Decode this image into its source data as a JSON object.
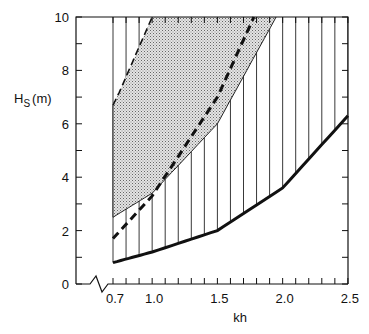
{
  "chart_data": {
    "type": "line",
    "title": "",
    "xlabel": "kh",
    "ylabel": "H_S (m)",
    "ylabel_main": "H",
    "ylabel_sub": "S",
    "ylabel_unit": "(m)",
    "xlim": [
      0.7,
      2.5
    ],
    "ylim": [
      0,
      10
    ],
    "x_axis_break": true,
    "x_ticks": [
      0.7,
      1.0,
      1.5,
      2.0,
      2.5
    ],
    "x_tick_labels": [
      "0.7",
      "1.0",
      "1.5",
      "2.0",
      "2.5"
    ],
    "y_ticks": [
      0,
      2,
      4,
      6,
      8,
      10
    ],
    "y_tick_labels": [
      "0",
      "2",
      "4",
      "6",
      "8",
      "10"
    ],
    "grid": false,
    "series": [
      {
        "name": "lower-bound-thick-solid",
        "style": "thick solid",
        "x": [
          0.7,
          1.0,
          1.5,
          2.0,
          2.5
        ],
        "y": [
          0.8,
          1.2,
          2.0,
          3.6,
          6.3
        ]
      },
      {
        "name": "thick-dashed",
        "style": "thick dashed",
        "x": [
          0.7,
          1.0,
          1.5,
          1.78
        ],
        "y": [
          1.7,
          3.3,
          7.0,
          10.0
        ]
      },
      {
        "name": "stippled-region-lower-edge",
        "style": "thin solid",
        "x": [
          0.7,
          1.0,
          1.5,
          1.95
        ],
        "y": [
          2.5,
          3.4,
          6.0,
          10.0
        ]
      },
      {
        "name": "thin-dashed-upper",
        "style": "thin dashed",
        "x": [
          0.7,
          0.75,
          1.0
        ],
        "y": [
          6.7,
          7.2,
          10.0
        ]
      }
    ],
    "regions": [
      {
        "name": "stippled-region",
        "fill": "stipple",
        "bounded_by": [
          "thin-dashed-upper",
          "stippled-region-lower-edge",
          "x=0.7",
          "y=10"
        ]
      },
      {
        "name": "hatched-region",
        "fill": "vertical-hatch",
        "bounded_by": [
          "lower-bound-thick-solid",
          "y=10",
          "x=0.7"
        ]
      }
    ]
  }
}
